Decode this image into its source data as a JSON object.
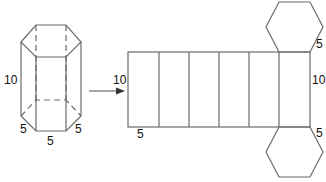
{
  "diagram": {
    "type": "hexagonal-prism-net",
    "prism": {
      "labels": {
        "height": "10",
        "bottom_left_edge": "5",
        "bottom_front_edge": "5",
        "bottom_right_edge": "5"
      }
    },
    "arrow": {
      "direction": "right"
    },
    "net": {
      "faces": 6,
      "labels": {
        "left_height": "10",
        "bottom_width": "5",
        "right_height": "10",
        "top_hex_edge": "5",
        "bottom_hex_edge": "5"
      }
    },
    "colors": {
      "line": "#6a6a6a",
      "text": "#111111",
      "background": "#ffffff"
    }
  }
}
